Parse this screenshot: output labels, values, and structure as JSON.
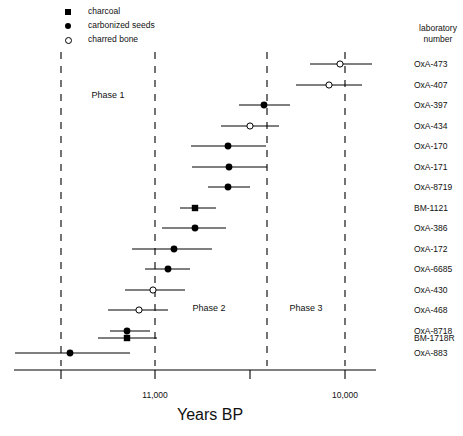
{
  "chart_data": {
    "type": "scatter",
    "title": "",
    "xlabel": "Years BP",
    "ylabel": "laboratory number",
    "grid": false,
    "legend_position": "top-left",
    "xlim": [
      11250,
      9900
    ],
    "x_axis_reversed": true,
    "ticks": [
      {
        "value": 11500,
        "label": "",
        "px": 61
      },
      {
        "value": 11000,
        "label": "11,000",
        "px": 155
      },
      {
        "value": 10500,
        "label": "",
        "px": 250
      },
      {
        "value": 10000,
        "label": "10,000",
        "px": 345
      }
    ],
    "tick_labels": [
      "11,000",
      "10,000"
    ],
    "legend": [
      {
        "name": "charcoal",
        "marker": "filled-square"
      },
      {
        "name": "carbonized seeds",
        "marker": "filled-circle"
      },
      {
        "name": "charred bone",
        "marker": "open-circle"
      }
    ],
    "phase_bounds": [
      {
        "value": 11500,
        "px": 61
      },
      {
        "value": 11000,
        "px": 155
      },
      {
        "value": 10400,
        "px": 267
      },
      {
        "value": 10000,
        "px": 345
      }
    ],
    "phases": [
      {
        "label": "Phase 1",
        "center_px": 108,
        "y_px": 97
      },
      {
        "label": "Phase 2",
        "center_px": 200,
        "y_px": 310
      },
      {
        "label": "Phase 3",
        "center_px": 300,
        "y_px": 310
      }
    ],
    "categories": [
      "OxA-473",
      "OxA-407",
      "OxA-397",
      "OxA-434",
      "OxA-170",
      "OxA-171",
      "OxA-8719",
      "BM-1121",
      "OxA-386",
      "OxA-172",
      "OxA-6685",
      "OxA-430",
      "OxA-468",
      "OxA-8718",
      "BM-1718R",
      "OxA-883"
    ],
    "points": [
      {
        "label": "OxA-473",
        "marker": "open-circle",
        "mean": 9975,
        "low": 10145,
        "high": 9645,
        "mean_px": 340,
        "low_px": 310,
        "high_px": 372,
        "y_px": 64
      },
      {
        "label": "OxA-407",
        "marker": "open-circle",
        "mean": 10035,
        "low": 10210,
        "high": 9715,
        "mean_px": 329,
        "low_px": 296,
        "high_px": 362,
        "y_px": 85
      },
      {
        "label": "OxA-397",
        "marker": "filled-circle",
        "mean": 10430,
        "low": 10560,
        "high": 10295,
        "mean_px": 264,
        "low_px": 239,
        "high_px": 290,
        "y_px": 105
      },
      {
        "label": "OxA-434",
        "marker": "open-circle",
        "mean": 10505,
        "low": 10660,
        "high": 10355,
        "mean_px": 250,
        "low_px": 221,
        "high_px": 279,
        "y_px": 126
      },
      {
        "label": "OxA-170",
        "marker": "filled-circle",
        "mean": 10620,
        "low": 10815,
        "high": 10425,
        "mean_px": 228,
        "low_px": 191,
        "high_px": 266,
        "y_px": 146
      },
      {
        "label": "OxA-171",
        "marker": "filled-circle",
        "mean": 10615,
        "low": 10810,
        "high": 10420,
        "mean_px": 229,
        "low_px": 192,
        "high_px": 267,
        "y_px": 167
      },
      {
        "label": "OxA-8719",
        "marker": "filled-circle",
        "mean": 10620,
        "low": 10730,
        "high": 10510,
        "mean_px": 228,
        "low_px": 208,
        "high_px": 250,
        "y_px": 187
      },
      {
        "label": "BM-1121",
        "marker": "filled-square",
        "mean": 10795,
        "low": 10875,
        "high": 10685,
        "mean_px": 195,
        "low_px": 180,
        "high_px": 216,
        "y_px": 208
      },
      {
        "label": "OxA-386",
        "marker": "filled-circle",
        "mean": 10795,
        "low": 10965,
        "high": 10630,
        "mean_px": 195,
        "low_px": 162,
        "high_px": 226,
        "y_px": 228
      },
      {
        "label": "OxA-172",
        "marker": "filled-circle",
        "mean": 10905,
        "low": 11125,
        "high": 10705,
        "mean_px": 174,
        "low_px": 132,
        "high_px": 212,
        "y_px": 249
      },
      {
        "label": "OxA-6685",
        "marker": "filled-circle",
        "mean": 10935,
        "low": 11055,
        "high": 10820,
        "mean_px": 168,
        "low_px": 145,
        "high_px": 190,
        "y_px": 269
      },
      {
        "label": "OxA-430",
        "marker": "open-circle",
        "mean": 11015,
        "low": 11160,
        "high": 10845,
        "mean_px": 153,
        "low_px": 125,
        "high_px": 185,
        "y_px": 290
      },
      {
        "label": "OxA-468",
        "marker": "open-circle",
        "mean": 11090,
        "low": 11250,
        "high": 10935,
        "mean_px": 139,
        "low_px": 108,
        "high_px": 168,
        "y_px": 310
      },
      {
        "label": "OxA-8718",
        "marker": "filled-circle",
        "mean": 11155,
        "low": 11240,
        "high": 11025,
        "mean_px": 127,
        "low_px": 110,
        "high_px": 150,
        "y_px": 331
      },
      {
        "label": "BM-1718R",
        "marker": "filled-square",
        "mean": 11155,
        "low": 11305,
        "high": 11000,
        "mean_px": 127,
        "low_px": 98,
        "high_px": 157,
        "y_px": 338
      },
      {
        "label": "OxA-883",
        "marker": "filled-circle",
        "mean": 11455,
        "low": 11900,
        "high": 11120,
        "mean_px": 70,
        "low_px": 15,
        "high_px": 130,
        "y_px": 353
      }
    ]
  },
  "legend": {
    "items": [
      {
        "label": "charcoal"
      },
      {
        "label": "carbonized seeds"
      },
      {
        "label": "charred bone"
      }
    ]
  },
  "right_header": {
    "line1": "laboratory",
    "line2": "number"
  },
  "axis": {
    "title": "Years BP",
    "tick_left": "11,000",
    "tick_right": "10,000"
  },
  "phases": {
    "p1": "Phase 1",
    "p2": "Phase 2",
    "p3": "Phase 3"
  }
}
